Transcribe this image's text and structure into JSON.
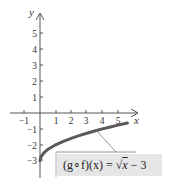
{
  "chart_data": {
    "type": "line",
    "title": "",
    "xlabel": "x",
    "ylabel": "y",
    "xlim": [
      -1.3,
      5.8
    ],
    "ylim": [
      -3.6,
      5.9
    ],
    "x_ticks": [
      "-1",
      "1",
      "2",
      "3",
      "4",
      "5"
    ],
    "y_ticks": [
      "5",
      "4",
      "3",
      "2",
      "1",
      "-1",
      "-2",
      "-3"
    ],
    "grid": false,
    "series": [
      {
        "name": "(g∘f)(x) = √x − 3",
        "x": [
          0,
          0.05,
          0.25,
          0.5,
          1,
          1.5,
          2,
          2.5,
          3,
          3.5,
          4,
          4.5,
          5,
          5.6
        ],
        "y": [
          -3,
          -2.78,
          -2.5,
          -2.29,
          -2,
          -1.78,
          -1.59,
          -1.42,
          -1.27,
          -1.13,
          -1,
          -0.88,
          -0.76,
          -0.63
        ]
      }
    ],
    "annotations": [
      {
        "text": "(g∘f)(x) = √x − 3",
        "points_to": [
          3.5,
          -1.13
        ]
      }
    ],
    "colors": {
      "curve": "#555555",
      "axes": "#555555",
      "label_box": "#e6e6e6"
    }
  },
  "labels": {
    "y_axis": "y",
    "x_axis": "x",
    "formula_left": "(g∘f)(x) = ",
    "formula_sqrt": "√",
    "formula_x": "x",
    "formula_right": " − 3"
  },
  "ticks": {
    "x": [
      {
        "label": "-1",
        "px": 24
      },
      {
        "label": "1",
        "px": 56
      },
      {
        "label": "2",
        "px": 71
      },
      {
        "label": "3",
        "px": 86
      },
      {
        "label": "4",
        "px": 102
      },
      {
        "label": "5",
        "px": 118
      }
    ],
    "y": [
      {
        "label": "5",
        "py": 33
      },
      {
        "label": "4",
        "py": 49
      },
      {
        "label": "3",
        "py": 65
      },
      {
        "label": "2",
        "py": 81
      },
      {
        "label": "1",
        "py": 97
      },
      {
        "label": "-1",
        "py": 129
      },
      {
        "label": "-2",
        "py": 145
      },
      {
        "label": "-3",
        "py": 160
      }
    ]
  }
}
